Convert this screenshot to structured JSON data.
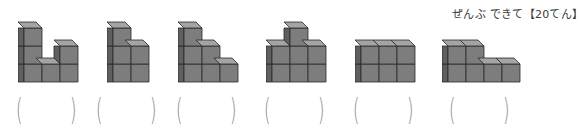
{
  "header": {
    "score_label": "ぜんぶ できて【20てん】"
  },
  "colors": {
    "front": "#7d7d7d",
    "top": "#a4a4a4",
    "side": "#5f5f5f",
    "edge": "#2a2a2a",
    "paren": "#8a8a8a"
  },
  "figures": [
    {
      "id": 1,
      "columns": [
        3,
        1,
        2
      ],
      "x": 18,
      "answer": ""
    },
    {
      "id": 2,
      "columns": [
        3,
        2
      ],
      "x": 107,
      "answer": ""
    },
    {
      "id": 3,
      "columns": [
        3,
        2,
        1
      ],
      "x": 178,
      "answer": ""
    },
    {
      "id": 4,
      "columns": [
        2,
        3,
        2
      ],
      "x": 266,
      "answer": ""
    },
    {
      "id": 5,
      "columns": [
        2,
        2,
        2
      ],
      "x": 355,
      "answer": ""
    },
    {
      "id": 6,
      "columns": [
        2,
        2,
        1,
        1
      ],
      "x": 442,
      "answer": ""
    }
  ],
  "parens": {
    "open": "(",
    "close": ")"
  }
}
